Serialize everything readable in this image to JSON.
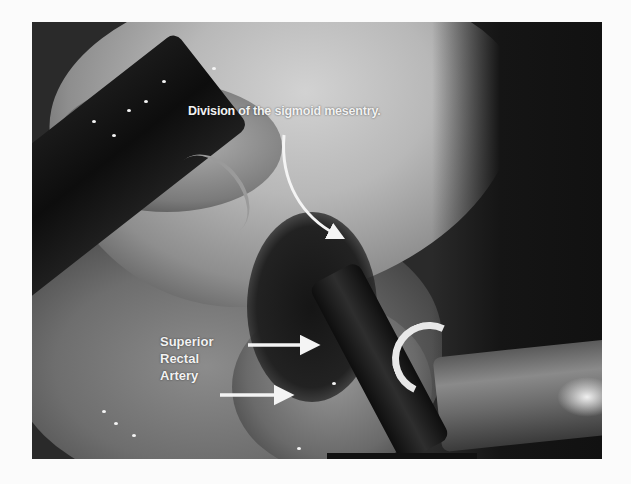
{
  "figure": {
    "annotations": {
      "top_label": "Division of the sigmoid mesentry.",
      "lower_label_lines": [
        "Superior",
        "Rectal",
        "Artery"
      ]
    },
    "arrows": [
      {
        "name": "curved-arrow-to-mesentery",
        "from": [
          283,
          135
        ],
        "to": [
          345,
          240
        ]
      },
      {
        "name": "arrow-to-artery-upper",
        "from": [
          247,
          345
        ],
        "to": [
          312,
          345
        ]
      },
      {
        "name": "arrow-to-artery-lower",
        "from": [
          220,
          395
        ],
        "to": [
          285,
          395
        ]
      }
    ],
    "colors": {
      "background": "#fbfbfb",
      "label": "#f2f2f2"
    }
  }
}
